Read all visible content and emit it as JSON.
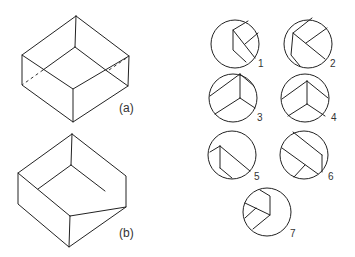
{
  "figures": {
    "box_a": {
      "label": "(a)",
      "description": "Isometric box with hidden edges dashed"
    },
    "box_b": {
      "label": "(b)",
      "description": "Isometric open box viewed from above"
    }
  },
  "views": [
    {
      "id": 1,
      "label": "1"
    },
    {
      "id": 2,
      "label": "2"
    },
    {
      "id": 3,
      "label": "3"
    },
    {
      "id": 4,
      "label": "4"
    },
    {
      "id": 5,
      "label": "5"
    },
    {
      "id": 6,
      "label": "6"
    },
    {
      "id": 7,
      "label": "7"
    }
  ],
  "colors": {
    "line": "#222222",
    "background": "#ffffff"
  }
}
